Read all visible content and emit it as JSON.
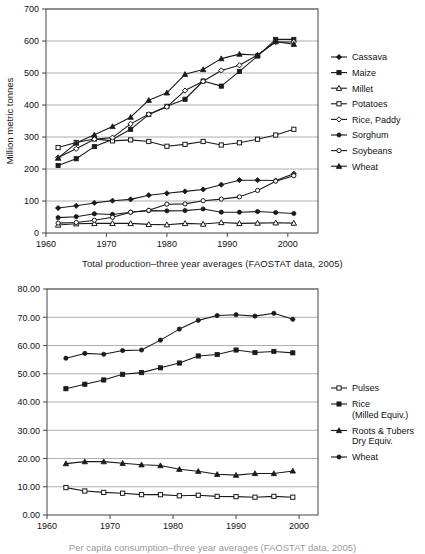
{
  "page": {
    "background": "#ffffff",
    "width": 425,
    "height": 554
  },
  "figures": [
    {
      "id": "top",
      "caption": "Total production–three year averages (FAOSTAT data, 2005)"
    },
    {
      "id": "bottom",
      "caption": "Per capita consumption–three year averages (FAOSTAT data, 2005)"
    }
  ],
  "chart_data": [
    {
      "id": "top-chart",
      "type": "line",
      "title": "",
      "xlabel": "Total production–three year averages (FAOSTAT data, 2005)",
      "ylabel": "Million metric tonnes",
      "xlim": [
        1960,
        2005
      ],
      "ylim": [
        0,
        700
      ],
      "xticks": [
        1960,
        1970,
        1980,
        1990,
        2000
      ],
      "yticks": [
        0,
        100,
        200,
        300,
        400,
        500,
        600,
        700
      ],
      "xtick_labels": [
        "1960",
        "1970",
        "1980",
        "1990",
        "2000"
      ],
      "ytick_labels": [
        "0",
        "100",
        "200",
        "300",
        "400",
        "500",
        "600",
        "700"
      ],
      "grid": "horizontal",
      "legend_position": "right",
      "x": [
        1962,
        1965,
        1968,
        1971,
        1974,
        1977,
        1980,
        1983,
        1986,
        1989,
        1992,
        1995,
        1998,
        2001
      ],
      "series": [
        {
          "name": "Cassava",
          "marker": "filled-diamond",
          "values": [
            78,
            85,
            94,
            101,
            105,
            118,
            124,
            130,
            136,
            151,
            165,
            165,
            164,
            185
          ]
        },
        {
          "name": "Maize",
          "marker": "filled-square",
          "values": [
            211,
            232,
            270,
            292,
            324,
            370,
            396,
            418,
            475,
            459,
            505,
            553,
            605,
            605
          ]
        },
        {
          "name": "Millet",
          "marker": "open-triangle",
          "values": [
            25,
            29,
            30,
            30,
            30,
            27,
            26,
            30,
            28,
            33,
            30,
            31,
            32,
            31
          ]
        },
        {
          "name": "Potatoes",
          "marker": "open-square",
          "values": [
            267,
            283,
            294,
            288,
            291,
            286,
            271,
            277,
            286,
            275,
            282,
            293,
            306,
            324
          ]
        },
        {
          "name": "Rice, Paddy",
          "marker": "open-diamond",
          "values": [
            236,
            263,
            293,
            298,
            341,
            371,
            394,
            445,
            474,
            508,
            524,
            556,
            597,
            597
          ]
        },
        {
          "name": "Sorghum",
          "marker": "filled-circle",
          "values": [
            48,
            51,
            60,
            58,
            65,
            70,
            69,
            70,
            75,
            65,
            65,
            67,
            64,
            61
          ]
        },
        {
          "name": "Soybeans",
          "marker": "open-circle",
          "values": [
            31,
            33,
            40,
            49,
            65,
            71,
            90,
            91,
            101,
            106,
            113,
            133,
            162,
            179
          ]
        },
        {
          "name": "Wheat",
          "marker": "filled-triangle",
          "values": [
            234,
            281,
            307,
            333,
            362,
            415,
            438,
            496,
            511,
            545,
            559,
            556,
            598,
            590
          ]
        }
      ]
    },
    {
      "id": "bottom-chart",
      "type": "line",
      "title": "",
      "xlabel": "Per capita consumption–three year averages (FAOSTAT data, 2005)",
      "ylabel": "",
      "xlim": [
        1960,
        2003
      ],
      "ylim": [
        0,
        80
      ],
      "xticks": [
        1960,
        1970,
        1980,
        1990,
        2000
      ],
      "yticks": [
        0,
        10,
        20,
        30,
        40,
        50,
        60,
        70,
        80
      ],
      "xtick_labels": [
        "1960",
        "1970",
        "1980",
        "1990",
        "2000"
      ],
      "ytick_labels": [
        "0.00",
        "10.00",
        "20.00",
        "30.00",
        "40.00",
        "50.00",
        "60.00",
        "70.00",
        "80.00"
      ],
      "grid": "horizontal",
      "legend_position": "right",
      "x": [
        1963,
        1966,
        1969,
        1972,
        1975,
        1978,
        1981,
        1984,
        1987,
        1990,
        1993,
        1996,
        1999
      ],
      "series": [
        {
          "name": "Pulses",
          "marker": "open-square",
          "values": [
            9.7,
            8.5,
            8.0,
            7.7,
            7.2,
            7.2,
            6.8,
            7.0,
            6.6,
            6.5,
            6.3,
            6.6,
            6.3
          ]
        },
        {
          "name": "Rice\n(Milled Equiv.)",
          "marker": "filled-square",
          "values": [
            44.7,
            46.3,
            47.8,
            49.8,
            50.4,
            52.1,
            53.8,
            56.3,
            56.8,
            58.4,
            57.5,
            57.9,
            57.4
          ]
        },
        {
          "name": "Roots & Tubers\nDry Equiv.",
          "marker": "filled-triangle",
          "values": [
            18.2,
            18.9,
            18.9,
            18.3,
            17.8,
            17.5,
            16.2,
            15.5,
            14.4,
            14.1,
            14.7,
            14.7,
            15.6
          ]
        },
        {
          "name": "Wheat",
          "marker": "filled-circle",
          "values": [
            55.5,
            57.2,
            56.9,
            58.2,
            58.4,
            61.9,
            65.8,
            68.9,
            70.6,
            70.9,
            70.4,
            71.4,
            69.3
          ]
        }
      ]
    }
  ],
  "legends": {
    "top": [
      {
        "label": "Cassava",
        "marker": "filled-diamond"
      },
      {
        "label": "Maize",
        "marker": "filled-square"
      },
      {
        "label": "Millet",
        "marker": "open-triangle"
      },
      {
        "label": "Potatoes",
        "marker": "open-square"
      },
      {
        "label": "Rice, Paddy",
        "marker": "open-diamond"
      },
      {
        "label": "Sorghum",
        "marker": "filled-circle"
      },
      {
        "label": "Soybeans",
        "marker": "open-circle"
      },
      {
        "label": "Wheat",
        "marker": "filled-triangle"
      }
    ],
    "bottom": [
      {
        "label": "Pulses",
        "marker": "open-square",
        "lines": [
          "Pulses"
        ]
      },
      {
        "label": "Rice (Milled Equiv.)",
        "marker": "filled-square",
        "lines": [
          "Rice",
          "(Milled Equiv.)"
        ]
      },
      {
        "label": "Roots & Tubers Dry Equiv.",
        "marker": "filled-triangle",
        "lines": [
          "Roots & Tubers",
          "Dry Equiv."
        ]
      },
      {
        "label": "Wheat",
        "marker": "filled-circle",
        "lines": [
          "Wheat"
        ]
      }
    ]
  },
  "colors": {
    "line": "#1a1a1a",
    "grid": "#9a9a9a",
    "axis": "#555555",
    "text": "#111111",
    "background": "#ffffff"
  }
}
